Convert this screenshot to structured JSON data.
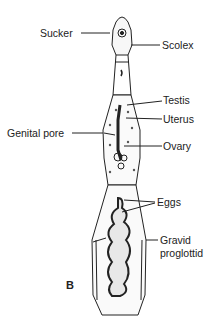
{
  "diagram": {
    "figure_letter": "B",
    "labels": {
      "sucker": "Sucker",
      "scolex": "Scolex",
      "testis": "Testis",
      "uterus": "Uterus",
      "genital_pore": "Genital pore",
      "ovary": "Ovary",
      "eggs": "Eggs",
      "gravid_line1": "Gravid",
      "gravid_line2": "proglottid"
    }
  }
}
